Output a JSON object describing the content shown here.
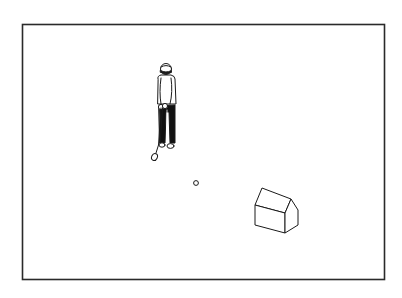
{
  "scene": {
    "description": "Line illustration of a golfer standing with a club, a golf ball, and a small house-shaped box inside a rectangular frame",
    "colors": {
      "background": "#ffffff",
      "stroke": "#1a1a1a",
      "pants": "#111111",
      "border": "#2a2a2a"
    },
    "frame": {
      "x": 22,
      "y": 24,
      "width": 363,
      "height": 256
    },
    "golfer": {
      "x": 155,
      "y": 63
    },
    "ball": {
      "cx": 196,
      "cy": 183,
      "r": 2.5
    },
    "house": {
      "x": 255,
      "y": 188
    }
  }
}
